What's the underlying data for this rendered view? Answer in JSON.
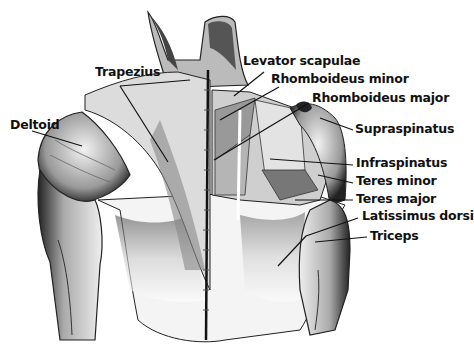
{
  "diagram": {
    "labels": [
      {
        "id": "trapezius",
        "text": "Trapezius",
        "x": 95,
        "y": 66,
        "line": [
          [
            120,
            86
          ],
          [
            190,
            80
          ]
        ],
        "line2": [
          [
            120,
            86
          ],
          [
            168,
            162
          ]
        ]
      },
      {
        "id": "deltoid",
        "text": "Deltoid",
        "x": 10,
        "y": 119,
        "line": [
          [
            32,
            131
          ],
          [
            82,
            146
          ]
        ]
      },
      {
        "id": "levator-scapulae",
        "text": "Levator scapulae",
        "x": 243,
        "y": 55,
        "line": [
          [
            264,
            72
          ],
          [
            234,
            96
          ]
        ]
      },
      {
        "id": "rhomboideus-minor",
        "text": "Rhomboideus minor",
        "x": 271,
        "y": 73,
        "line": [
          [
            279,
            87
          ],
          [
            220,
            120
          ]
        ]
      },
      {
        "id": "rhomboideus-major",
        "text": "Rhomboideus major",
        "x": 312,
        "y": 92,
        "line": [
          [
            309,
            103
          ],
          [
            214,
            160
          ]
        ]
      },
      {
        "id": "supraspinatus",
        "text": "Supraspinatus",
        "x": 355,
        "y": 123,
        "line": [
          [
            353,
            130
          ],
          [
            320,
            118
          ]
        ]
      },
      {
        "id": "infraspinatus",
        "text": "Infraspinatus",
        "x": 356,
        "y": 157,
        "line": [
          [
            353,
            165
          ],
          [
            270,
            159
          ]
        ]
      },
      {
        "id": "teres-minor",
        "text": "Teres minor",
        "x": 356,
        "y": 175,
        "line": [
          [
            353,
            183
          ],
          [
            318,
            175
          ]
        ]
      },
      {
        "id": "teres-major",
        "text": "Teres major",
        "x": 356,
        "y": 193,
        "line": [
          [
            353,
            200
          ],
          [
            295,
            200
          ]
        ]
      },
      {
        "id": "latissimus-dorsi",
        "text": "Latissimus dorsi",
        "x": 362,
        "y": 210,
        "line": [
          [
            358,
            218
          ],
          [
            306,
            236
          ]
        ],
        "line2": [
          [
            306,
            236
          ],
          [
            278,
            266
          ]
        ]
      },
      {
        "id": "triceps",
        "text": "Triceps",
        "x": 370,
        "y": 230,
        "line": [
          [
            367,
            237
          ],
          [
            315,
            242
          ]
        ]
      }
    ],
    "colors": {
      "ink": "#111111",
      "shade": "#3a3a3a",
      "mid": "#8a8a8a",
      "light": "#d8d8d8",
      "paper": "#ffffff"
    }
  }
}
